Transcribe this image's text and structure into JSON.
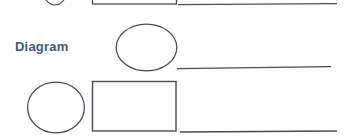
{
  "document": {
    "type": "worksheet-fragment",
    "background_color": "#ffffff",
    "ink_color": "#4a4a52",
    "label_color": "#44597a"
  },
  "labels": {
    "diagram": "Diagram"
  },
  "rows": [
    {
      "name": "row-partial-top",
      "shapes": [
        "circle-cropped",
        "rectangle"
      ],
      "answer_line": true
    },
    {
      "name": "row-diagram",
      "label": "Diagram",
      "shapes": [
        "circle"
      ],
      "answer_line": true
    },
    {
      "name": "row-bottom",
      "shapes": [
        "circle",
        "rectangle"
      ],
      "answer_line": true
    }
  ],
  "shapes": {
    "circle_top_cropped": {
      "cx": 55,
      "cy": -14,
      "rx": 13,
      "ry": 19
    },
    "rect_top": {
      "x": 92,
      "y": -22,
      "width": 84,
      "height": 26
    },
    "line_top": {
      "x1": 178,
      "y1": 4.5,
      "x2": 337,
      "y2": 3.5
    },
    "circle_middle": {
      "cx": 146.5,
      "cy": 47.5,
      "rx": 30.5,
      "ry": 23.5
    },
    "line_middle": {
      "x1": 177,
      "y1": 68.5,
      "x2": 331,
      "y2": 66.5
    },
    "circle_bottom": {
      "cx": 56,
      "cy": 107.5,
      "rx": 28.5,
      "ry": 25.5
    },
    "rect_bottom": {
      "x": 92,
      "y": 81,
      "width": 84,
      "height": 50
    },
    "line_bottom": {
      "x1": 180,
      "y1": 132,
      "x2": 337,
      "y2": 131
    }
  }
}
